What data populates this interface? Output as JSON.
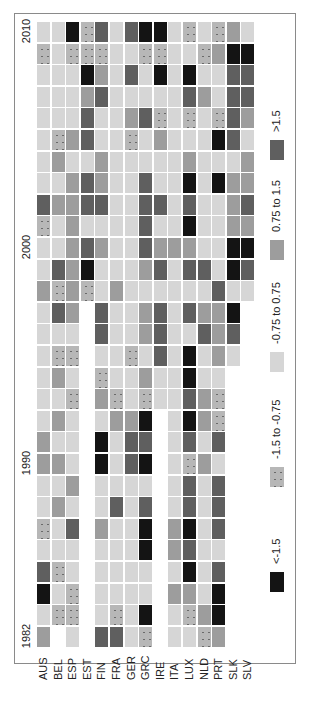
{
  "chart_data": {
    "type": "heatmap",
    "title": "",
    "xlabel": "",
    "ylabel": "",
    "orientation_note": "rotated 90 degrees counter-clockwise; countries along bottom, years bottom (1982) to top (2010)",
    "countries": [
      "AUS",
      "BEL",
      "ESP",
      "EST",
      "FIN",
      "FRA",
      "GER",
      "GRC",
      "IRE",
      "ITA",
      "LUX",
      "NLD",
      "PRT",
      "SLK",
      "SLV"
    ],
    "years": [
      2010,
      2009,
      2008,
      2007,
      2006,
      2005,
      2004,
      2003,
      2002,
      2001,
      2000,
      1999,
      1998,
      1997,
      1996,
      1995,
      1994,
      1993,
      1992,
      1991,
      1990,
      1989,
      1988,
      1987,
      1986,
      1985,
      1984,
      1983,
      1982
    ],
    "year_tick_labels": [
      "2010",
      "2000",
      "1990",
      "1982"
    ],
    "category_codes": {
      "D": "<-1.5",
      "S": "-1.5 to -0.75",
      "L": "-0.75 to 0.75",
      "M": "0.75 to 1.5",
      "H": ">1.5",
      "_": "no data"
    },
    "rows": [
      "LLDSHLHDDLSLSML",
      "SLSSSLLSSLLSMDD",
      "LLLDMLHLDLDLLHH",
      "LLLMHLLLLLHMLHH",
      "LLLHLLMHSLSLSHM",
      "LSMHLLSLMLLLDHL",
      "LMLLMLLLLLMLLLM",
      "LLMHMLLHLLDLDMM",
      "HMMHHLLHHLHLLMH",
      "SLMLLLLHLLDLLMM",
      "LLMHMLLHMMMLLDD",
      "LHMDLLLMHLHHLDH",
      "MSMSLMLLLLLLHLL",
      "LHM_HLLMHLHMMD_",
      "LLL_HLLMHLLHMH_",
      "LSS_LLSLHLDLML_",
      "LML_SLLMLLDLL__",
      "LLS_MSLSLLHMS__",
      "LML_LMMD_LDMS__",
      "MLL_DLHH_LHLH__",
      "MML_DLHD_LSML__",
      "LLM_LLLL_LHLH__",
      "LML_LHLH_LHLH__",
      "SLH_MLLD_MDLH__",
      "LLL_LLLD_MHLL__",
      "HSL_LLLL_LDLH__",
      "DLS_LLLL_MMLD__",
      "LSS_LSLD_LSMD__",
      "M_L_HHLS_LLSM__"
    ],
    "legend": [
      {
        "code": "D",
        "label": "<-1.5",
        "color": "#141414",
        "pattern": "solid"
      },
      {
        "code": "S",
        "label": "-1.5 to -0.75",
        "color": "#b7b7b7",
        "pattern": "dotted"
      },
      {
        "code": "L",
        "label": "-0.75 to 0.75",
        "color": "#d6d6d6",
        "pattern": "solid"
      },
      {
        "code": "M",
        "label": "0.75 to 1.5",
        "color": "#9d9d9d",
        "pattern": "solid"
      },
      {
        "code": "H",
        "label": ">1.5",
        "color": "#5f5f5f",
        "pattern": "solid"
      }
    ],
    "legend_position": "right (rotated, reads bottom-to-top)"
  }
}
